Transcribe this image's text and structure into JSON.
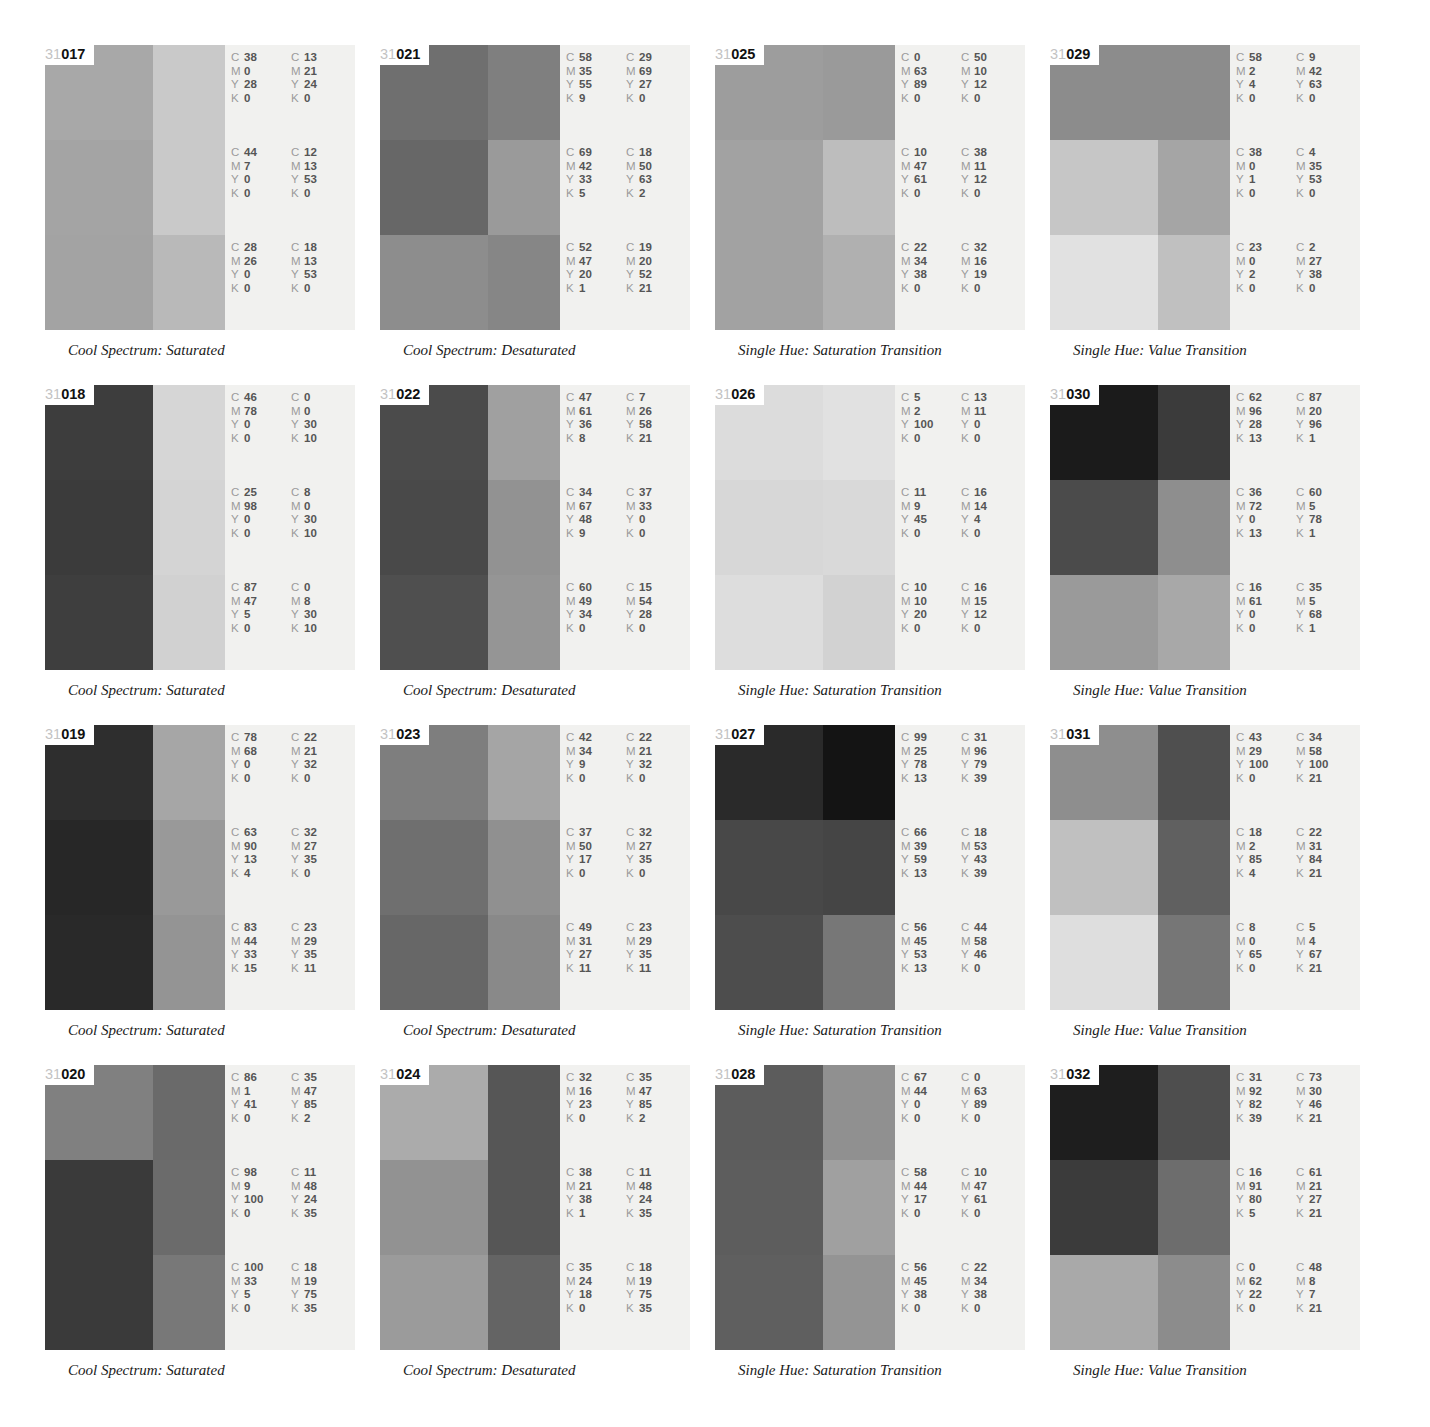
{
  "page": {
    "prefix": "31",
    "cmyk_channels": [
      "C",
      "M",
      "Y",
      "K"
    ]
  },
  "panels": [
    {
      "id": "017",
      "caption": "Cool Spectrum: Saturated",
      "swatches": [
        [
          "#a8a8a8",
          "#c9c9c9"
        ],
        [
          "#a4a4a4",
          "#c9c9c9"
        ],
        [
          "#a3a3a3",
          "#b9b9b9"
        ]
      ],
      "cmyk": [
        [
          {
            "C": "38",
            "M": "0",
            "Y": "28",
            "K": "0"
          },
          {
            "C": "13",
            "M": "21",
            "Y": "24",
            "K": "0"
          }
        ],
        [
          {
            "C": "44",
            "M": "7",
            "Y": "0",
            "K": "0"
          },
          {
            "C": "12",
            "M": "13",
            "Y": "53",
            "K": "0"
          }
        ],
        [
          {
            "C": "28",
            "M": "26",
            "Y": "0",
            "K": "0"
          },
          {
            "C": "18",
            "M": "13",
            "Y": "53",
            "K": "0"
          }
        ]
      ]
    },
    {
      "id": "021",
      "caption": "Cool Spectrum: Desaturated",
      "swatches": [
        [
          "#6f6f6f",
          "#7f7f7f"
        ],
        [
          "#676767",
          "#9a9a9a"
        ],
        [
          "#8d8d8d",
          "#868686"
        ]
      ],
      "cmyk": [
        [
          {
            "C": "58",
            "M": "35",
            "Y": "55",
            "K": "9"
          },
          {
            "C": "29",
            "M": "69",
            "Y": "27",
            "K": "0"
          }
        ],
        [
          {
            "C": "69",
            "M": "42",
            "Y": "33",
            "K": "5"
          },
          {
            "C": "18",
            "M": "50",
            "Y": "63",
            "K": "2"
          }
        ],
        [
          {
            "C": "52",
            "M": "47",
            "Y": "20",
            "K": "1"
          },
          {
            "C": "19",
            "M": "20",
            "Y": "52",
            "K": "21"
          }
        ]
      ]
    },
    {
      "id": "025",
      "caption": "Single Hue: Saturation Transition",
      "swatches": [
        [
          "#9d9d9d",
          "#9a9a9a"
        ],
        [
          "#a2a2a2",
          "#bdbdbd"
        ],
        [
          "#a2a2a2",
          "#b0b0b0"
        ]
      ],
      "cmyk": [
        [
          {
            "C": "0",
            "M": "63",
            "Y": "89",
            "K": "0"
          },
          {
            "C": "50",
            "M": "10",
            "Y": "12",
            "K": "0"
          }
        ],
        [
          {
            "C": "10",
            "M": "47",
            "Y": "61",
            "K": "0"
          },
          {
            "C": "38",
            "M": "11",
            "Y": "12",
            "K": "0"
          }
        ],
        [
          {
            "C": "22",
            "M": "34",
            "Y": "38",
            "K": "0"
          },
          {
            "C": "32",
            "M": "16",
            "Y": "19",
            "K": "0"
          }
        ]
      ]
    },
    {
      "id": "029",
      "caption": "Single Hue: Value Transition",
      "swatches": [
        [
          "#8c8c8c",
          "#8c8c8c"
        ],
        [
          "#c6c6c6",
          "#a5a5a5"
        ],
        [
          "#e1e1e1",
          "#c0c0c0"
        ]
      ],
      "cmyk": [
        [
          {
            "C": "58",
            "M": "2",
            "Y": "4",
            "K": "0"
          },
          {
            "C": "9",
            "M": "42",
            "Y": "63",
            "K": "0"
          }
        ],
        [
          {
            "C": "38",
            "M": "0",
            "Y": "1",
            "K": "0"
          },
          {
            "C": "4",
            "M": "35",
            "Y": "53",
            "K": "0"
          }
        ],
        [
          {
            "C": "23",
            "M": "0",
            "Y": "2",
            "K": "0"
          },
          {
            "C": "2",
            "M": "27",
            "Y": "38",
            "K": "0"
          }
        ]
      ]
    },
    {
      "id": "018",
      "caption": "Cool Spectrum: Saturated",
      "swatches": [
        [
          "#3d3d3d",
          "#d6d6d6"
        ],
        [
          "#3b3b3b",
          "#d4d4d4"
        ],
        [
          "#3e3e3e",
          "#d1d1d1"
        ]
      ],
      "cmyk": [
        [
          {
            "C": "46",
            "M": "78",
            "Y": "0",
            "K": "0"
          },
          {
            "C": "0",
            "M": "0",
            "Y": "30",
            "K": "10"
          }
        ],
        [
          {
            "C": "25",
            "M": "98",
            "Y": "0",
            "K": "0"
          },
          {
            "C": "8",
            "M": "0",
            "Y": "30",
            "K": "10"
          }
        ],
        [
          {
            "C": "87",
            "M": "47",
            "Y": "5",
            "K": "0"
          },
          {
            "C": "0",
            "M": "8",
            "Y": "30",
            "K": "10"
          }
        ]
      ]
    },
    {
      "id": "022",
      "caption": "Cool Spectrum: Desaturated",
      "swatches": [
        [
          "#4b4b4b",
          "#a0a0a0"
        ],
        [
          "#494949",
          "#929292"
        ],
        [
          "#4f4f4f",
          "#959595"
        ]
      ],
      "cmyk": [
        [
          {
            "C": "47",
            "M": "61",
            "Y": "36",
            "K": "8"
          },
          {
            "C": "7",
            "M": "26",
            "Y": "58",
            "K": "21"
          }
        ],
        [
          {
            "C": "34",
            "M": "67",
            "Y": "48",
            "K": "9"
          },
          {
            "C": "37",
            "M": "33",
            "Y": "0",
            "K": "0"
          }
        ],
        [
          {
            "C": "60",
            "M": "49",
            "Y": "34",
            "K": "0"
          },
          {
            "C": "15",
            "M": "54",
            "Y": "28",
            "K": "0"
          }
        ]
      ]
    },
    {
      "id": "026",
      "caption": "Single Hue: Saturation Transition",
      "swatches": [
        [
          "#dcdcdc",
          "#e1e1e1"
        ],
        [
          "#d7d7d7",
          "#d9d9d9"
        ],
        [
          "#dddddd",
          "#d2d2d2"
        ]
      ],
      "cmyk": [
        [
          {
            "C": "5",
            "M": "2",
            "Y": "100",
            "K": "0"
          },
          {
            "C": "13",
            "M": "11",
            "Y": "0",
            "K": "0"
          }
        ],
        [
          {
            "C": "11",
            "M": "9",
            "Y": "45",
            "K": "0"
          },
          {
            "C": "16",
            "M": "14",
            "Y": "4",
            "K": "0"
          }
        ],
        [
          {
            "C": "10",
            "M": "10",
            "Y": "20",
            "K": "0"
          },
          {
            "C": "16",
            "M": "15",
            "Y": "12",
            "K": "0"
          }
        ]
      ]
    },
    {
      "id": "030",
      "caption": "Single Hue: Value Transition",
      "swatches": [
        [
          "#1b1b1b",
          "#3b3b3b"
        ],
        [
          "#4b4b4b",
          "#8e8e8e"
        ],
        [
          "#9a9a9a",
          "#a8a8a8"
        ]
      ],
      "cmyk": [
        [
          {
            "C": "62",
            "M": "96",
            "Y": "28",
            "K": "13"
          },
          {
            "C": "87",
            "M": "20",
            "Y": "96",
            "K": "1"
          }
        ],
        [
          {
            "C": "36",
            "M": "72",
            "Y": "0",
            "K": "13"
          },
          {
            "C": "60",
            "M": "5",
            "Y": "78",
            "K": "1"
          }
        ],
        [
          {
            "C": "16",
            "M": "61",
            "Y": "0",
            "K": "0"
          },
          {
            "C": "35",
            "M": "5",
            "Y": "68",
            "K": "1"
          }
        ]
      ]
    },
    {
      "id": "019",
      "caption": "Cool Spectrum: Saturated",
      "swatches": [
        [
          "#2e2e2e",
          "#a6a6a6"
        ],
        [
          "#272727",
          "#999999"
        ],
        [
          "#292929",
          "#949494"
        ]
      ],
      "cmyk": [
        [
          {
            "C": "78",
            "M": "68",
            "Y": "0",
            "K": "0"
          },
          {
            "C": "22",
            "M": "21",
            "Y": "32",
            "K": "0"
          }
        ],
        [
          {
            "C": "63",
            "M": "90",
            "Y": "13",
            "K": "4"
          },
          {
            "C": "32",
            "M": "27",
            "Y": "35",
            "K": "0"
          }
        ],
        [
          {
            "C": "83",
            "M": "44",
            "Y": "33",
            "K": "15"
          },
          {
            "C": "23",
            "M": "29",
            "Y": "35",
            "K": "11"
          }
        ]
      ]
    },
    {
      "id": "023",
      "caption": "Cool Spectrum: Desaturated",
      "swatches": [
        [
          "#7e7e7e",
          "#a5a5a5"
        ],
        [
          "#6f6f6f",
          "#909090"
        ],
        [
          "#676767",
          "#898989"
        ]
      ],
      "cmyk": [
        [
          {
            "C": "42",
            "M": "34",
            "Y": "9",
            "K": "0"
          },
          {
            "C": "22",
            "M": "21",
            "Y": "32",
            "K": "0"
          }
        ],
        [
          {
            "C": "37",
            "M": "50",
            "Y": "17",
            "K": "0"
          },
          {
            "C": "32",
            "M": "27",
            "Y": "35",
            "K": "0"
          }
        ],
        [
          {
            "C": "49",
            "M": "31",
            "Y": "27",
            "K": "11"
          },
          {
            "C": "23",
            "M": "29",
            "Y": "35",
            "K": "11"
          }
        ]
      ]
    },
    {
      "id": "027",
      "caption": "Single Hue: Saturation Transition",
      "swatches": [
        [
          "#2a2a2a",
          "#141414"
        ],
        [
          "#484848",
          "#454545"
        ],
        [
          "#4d4d4d",
          "#777777"
        ]
      ],
      "cmyk": [
        [
          {
            "C": "99",
            "M": "25",
            "Y": "78",
            "K": "13"
          },
          {
            "C": "31",
            "M": "96",
            "Y": "79",
            "K": "39"
          }
        ],
        [
          {
            "C": "66",
            "M": "39",
            "Y": "59",
            "K": "13"
          },
          {
            "C": "18",
            "M": "53",
            "Y": "43",
            "K": "39"
          }
        ],
        [
          {
            "C": "56",
            "M": "45",
            "Y": "53",
            "K": "13"
          },
          {
            "C": "44",
            "M": "58",
            "Y": "46",
            "K": "0"
          }
        ]
      ]
    },
    {
      "id": "031",
      "caption": "Single Hue: Value Transition",
      "swatches": [
        [
          "#8e8e8e",
          "#4f4f4f"
        ],
        [
          "#c0c0c0",
          "#606060"
        ],
        [
          "#dedede",
          "#767676"
        ]
      ],
      "cmyk": [
        [
          {
            "C": "43",
            "M": "29",
            "Y": "100",
            "K": "0"
          },
          {
            "C": "34",
            "M": "58",
            "Y": "100",
            "K": "21"
          }
        ],
        [
          {
            "C": "18",
            "M": "2",
            "Y": "85",
            "K": "4"
          },
          {
            "C": "22",
            "M": "31",
            "Y": "84",
            "K": "21"
          }
        ],
        [
          {
            "C": "8",
            "M": "0",
            "Y": "65",
            "K": "0"
          },
          {
            "C": "5",
            "M": "4",
            "Y": "67",
            "K": "21"
          }
        ]
      ]
    },
    {
      "id": "020",
      "caption": "Cool Spectrum: Saturated",
      "swatches": [
        [
          "#808080",
          "#6a6a6a"
        ],
        [
          "#3a3a3a",
          "#6b6b6b"
        ],
        [
          "#3a3a3a",
          "#787878"
        ]
      ],
      "cmyk": [
        [
          {
            "C": "86",
            "M": "1",
            "Y": "41",
            "K": "0"
          },
          {
            "C": "35",
            "M": "47",
            "Y": "85",
            "K": "2"
          }
        ],
        [
          {
            "C": "98",
            "M": "9",
            "Y": "100",
            "K": "0"
          },
          {
            "C": "11",
            "M": "48",
            "Y": "24",
            "K": "35"
          }
        ],
        [
          {
            "C": "100",
            "M": "33",
            "Y": "5",
            "K": "0"
          },
          {
            "C": "18",
            "M": "19",
            "Y": "75",
            "K": "35"
          }
        ]
      ]
    },
    {
      "id": "024",
      "caption": "Cool Spectrum: Desaturated",
      "swatches": [
        [
          "#ababab",
          "#565656"
        ],
        [
          "#929292",
          "#565656"
        ],
        [
          "#9b9b9b",
          "#646464"
        ]
      ],
      "cmyk": [
        [
          {
            "C": "32",
            "M": "16",
            "Y": "23",
            "K": "0"
          },
          {
            "C": "35",
            "M": "47",
            "Y": "85",
            "K": "2"
          }
        ],
        [
          {
            "C": "38",
            "M": "21",
            "Y": "38",
            "K": "1"
          },
          {
            "C": "11",
            "M": "48",
            "Y": "24",
            "K": "35"
          }
        ],
        [
          {
            "C": "35",
            "M": "24",
            "Y": "18",
            "K": "0"
          },
          {
            "C": "18",
            "M": "19",
            "Y": "75",
            "K": "35"
          }
        ]
      ]
    },
    {
      "id": "028",
      "caption": "Single Hue: Saturation Transition",
      "swatches": [
        [
          "#5c5c5c",
          "#909090"
        ],
        [
          "#5d5d5d",
          "#a0a0a0"
        ],
        [
          "#5f5f5f",
          "#949494"
        ]
      ],
      "cmyk": [
        [
          {
            "C": "67",
            "M": "44",
            "Y": "0",
            "K": "0"
          },
          {
            "C": "0",
            "M": "63",
            "Y": "89",
            "K": "0"
          }
        ],
        [
          {
            "C": "58",
            "M": "44",
            "Y": "17",
            "K": "0"
          },
          {
            "C": "10",
            "M": "47",
            "Y": "61",
            "K": "0"
          }
        ],
        [
          {
            "C": "56",
            "M": "45",
            "Y": "38",
            "K": "0"
          },
          {
            "C": "22",
            "M": "34",
            "Y": "38",
            "K": "0"
          }
        ]
      ]
    },
    {
      "id": "032",
      "caption": "Single Hue: Value Transition",
      "swatches": [
        [
          "#1e1e1e",
          "#4e4e4e"
        ],
        [
          "#3b3b3b",
          "#6d6d6d"
        ],
        [
          "#a9a9a9",
          "#8c8c8c"
        ]
      ],
      "cmyk": [
        [
          {
            "C": "31",
            "M": "92",
            "Y": "82",
            "K": "39"
          },
          {
            "C": "73",
            "M": "30",
            "Y": "46",
            "K": "21"
          }
        ],
        [
          {
            "C": "16",
            "M": "91",
            "Y": "80",
            "K": "5"
          },
          {
            "C": "61",
            "M": "21",
            "Y": "27",
            "K": "21"
          }
        ],
        [
          {
            "C": "0",
            "M": "62",
            "Y": "22",
            "K": "0"
          },
          {
            "C": "48",
            "M": "8",
            "Y": "7",
            "K": "21"
          }
        ]
      ]
    }
  ]
}
